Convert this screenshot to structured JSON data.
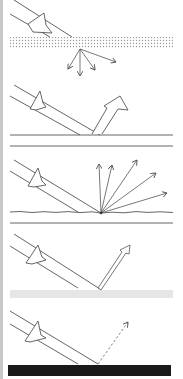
{
  "figure": {
    "panels": [
      {
        "id": "scattering-layer",
        "surface": "dotted translucent layer",
        "reflection": "diffuse scattered arrows below layer"
      },
      {
        "id": "specular-reflection",
        "surface": "smooth flat surface",
        "reflection": "single large reflected arrow"
      },
      {
        "id": "diffuse-reflection",
        "surface": "rough surface",
        "reflection": "multiple thin arrows fanning out"
      },
      {
        "id": "partial-reflection",
        "surface": "light gray surface",
        "reflection": "thin reflected arrow"
      },
      {
        "id": "absorption",
        "surface": "black surface",
        "reflection": "faint dashed reflected arrow"
      }
    ],
    "colors": {
      "line": "#555555",
      "dots": "#9a9a9a",
      "gray_surface": "#e6e6e6",
      "black_surface": "#1a1a1a",
      "border": "#c8c8c8"
    }
  }
}
